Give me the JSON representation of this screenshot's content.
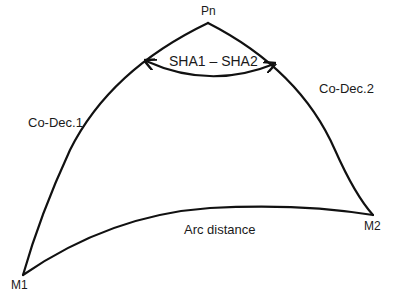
{
  "diagram": {
    "type": "spherical-triangle",
    "vertices": {
      "pole": {
        "label": "Pn"
      },
      "position1": {
        "label": "M1"
      },
      "position2": {
        "label": "M2"
      }
    },
    "sides": {
      "side_pole_m1": {
        "label": "Co-Dec.1"
      },
      "side_pole_m2": {
        "label": "Co-Dec.2"
      },
      "side_m1_m2": {
        "label": "Arc distance"
      }
    },
    "angle_at_pole": {
      "label": "SHA1 – SHA2"
    },
    "colors": {
      "stroke": "#111111",
      "text": "#1a1a1a",
      "background": "#ffffff"
    }
  }
}
